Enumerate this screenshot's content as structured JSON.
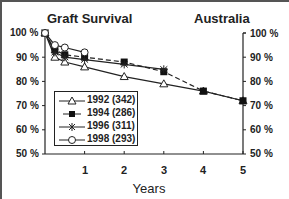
{
  "chart_data": {
    "type": "line",
    "title": "Graft Survival",
    "subtitle": "Australia",
    "xlabel": "Years",
    "ylabel": "",
    "xlim": [
      0,
      5
    ],
    "ylim": [
      50,
      100
    ],
    "x_ticks": [
      "1",
      "2",
      "3",
      "4",
      "5"
    ],
    "y_ticks": [
      "100 %",
      "90 %",
      "80 %",
      "70 %",
      "60 %",
      "50 %"
    ],
    "grid": false,
    "legend_position": "lower-left inside",
    "series": [
      {
        "name": "1992 (342)",
        "marker": "triangle-open",
        "line": "solid",
        "x": [
          0,
          0.25,
          0.5,
          1,
          2,
          3,
          4,
          5
        ],
        "values": [
          100,
          90,
          88,
          86,
          82,
          79,
          76,
          72
        ]
      },
      {
        "name": "1994 (286)",
        "marker": "square-filled",
        "line": "dashed",
        "x": [
          0,
          0.25,
          0.5,
          1,
          2,
          3,
          4,
          5
        ],
        "values": [
          100,
          93,
          91,
          90,
          88,
          84,
          76,
          72
        ]
      },
      {
        "name": "1996 (311)",
        "marker": "asterisk",
        "line": "solid",
        "x": [
          0,
          0.25,
          0.5,
          1,
          2,
          3
        ],
        "values": [
          100,
          92,
          90,
          89,
          87,
          85
        ]
      },
      {
        "name": "1998 (293)",
        "marker": "circle-open",
        "line": "solid",
        "x": [
          0,
          0.25,
          0.5,
          1
        ],
        "values": [
          100,
          95,
          94,
          92
        ]
      }
    ]
  },
  "header": {
    "title": "Graft Survival",
    "region": "Australia"
  },
  "axes": {
    "left_ticks": [
      "100 %",
      "90 %",
      "80 %",
      "70 %",
      "60 %",
      "50 %"
    ],
    "right_ticks": [
      "100 %",
      "90 %",
      "80 %",
      "70 %",
      "60 %",
      "50 %"
    ],
    "x_ticks": [
      "1",
      "2",
      "3",
      "4",
      "5"
    ],
    "x_label": "Years"
  },
  "legend": {
    "items": [
      {
        "label": "1992 (342)"
      },
      {
        "label": "1994 (286)"
      },
      {
        "label": "1996 (311)"
      },
      {
        "label": "1998 (293)"
      }
    ]
  }
}
